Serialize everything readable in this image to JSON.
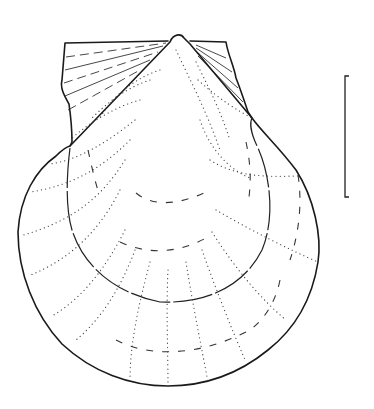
{
  "figure": {
    "subject": "Scallop shell (Pectinidae) valve, line drawing",
    "style": "stippled radial ribs, dashed growth lines",
    "colors": {
      "ink": "#1a1a1a",
      "background": "#ffffff"
    }
  },
  "scale_bar": {
    "label": "",
    "orientation": "vertical"
  }
}
